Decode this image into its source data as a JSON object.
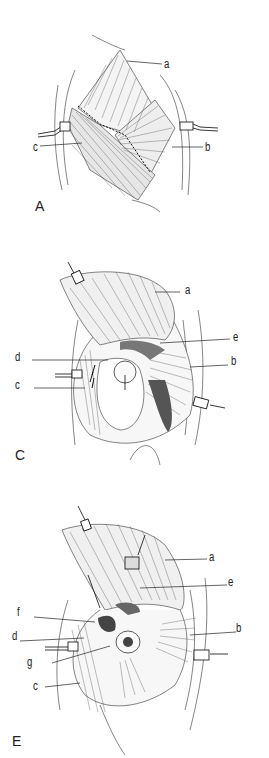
{
  "figure": {
    "panels": [
      {
        "id": "A",
        "panel_label": "A",
        "labels": {
          "a": "a",
          "b": "b",
          "c": "c"
        }
      },
      {
        "id": "C",
        "panel_label": "C",
        "labels": {
          "a": "a",
          "b": "b",
          "c": "c",
          "d": "d",
          "e": "e"
        }
      },
      {
        "id": "E",
        "panel_label": "E",
        "labels": {
          "a": "a",
          "b": "b",
          "c": "c",
          "d": "d",
          "e": "e",
          "f": "f",
          "g": "g"
        }
      }
    ],
    "colors": {
      "ink": "#222222",
      "background": "#ffffff",
      "shade": "#555555"
    }
  }
}
